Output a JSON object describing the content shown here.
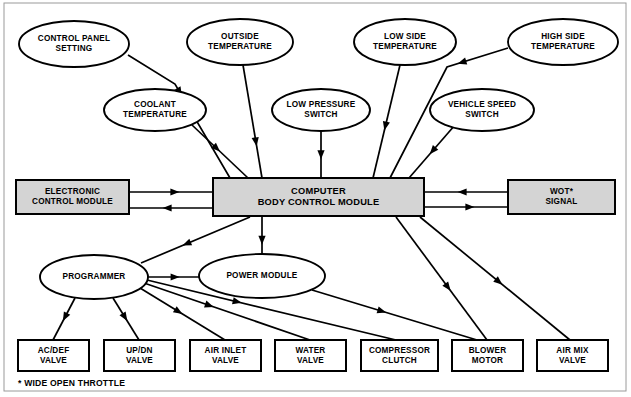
{
  "diagram": {
    "frame": {
      "x": 4,
      "y": 3,
      "w": 622,
      "h": 388,
      "stroke": "#9a9a9a"
    },
    "colors": {
      "shaded_fill": "#d4d4d4",
      "plain_fill": "#ffffff",
      "stroke": "#000000",
      "frame": "#9a9a9a"
    },
    "inputs": [
      {
        "id": "control-panel-setting",
        "label": "CONTROL PANEL\nSETTING",
        "shape": "ellipse",
        "cx": 74,
        "cy": 44,
        "rx": 55,
        "ry": 23
      },
      {
        "id": "outside-temperature",
        "label": "OUTSIDE\nTEMPERATURE",
        "shape": "ellipse",
        "cx": 240,
        "cy": 42,
        "rx": 53,
        "ry": 23
      },
      {
        "id": "low-side-temperature",
        "label": "LOW SIDE\nTEMPERATURE",
        "shape": "ellipse",
        "cx": 405,
        "cy": 42,
        "rx": 51,
        "ry": 23
      },
      {
        "id": "high-side-temperature",
        "label": "HIGH SIDE\nTEMPERATURE",
        "shape": "ellipse",
        "cx": 563,
        "cy": 42,
        "rx": 55,
        "ry": 23
      },
      {
        "id": "coolant-temperature",
        "label": "COOLANT\nTEMPERATURE",
        "shape": "ellipse",
        "cx": 155,
        "cy": 110,
        "rx": 51,
        "ry": 21
      },
      {
        "id": "low-pressure-switch",
        "label": "LOW PRESSURE\nSWITCH",
        "shape": "ellipse",
        "cx": 321,
        "cy": 110,
        "rx": 49,
        "ry": 21
      },
      {
        "id": "vehicle-speed-switch",
        "label": "VEHICLE SPEED\nSWITCH",
        "shape": "ellipse",
        "cx": 482,
        "cy": 110,
        "rx": 52,
        "ry": 21
      }
    ],
    "modules": [
      {
        "id": "electronic-control-module",
        "label": "ELECTRONIC\nCONTROL MODULE",
        "shape": "rect",
        "x": 16,
        "y": 180,
        "w": 113,
        "h": 34,
        "shaded": true
      },
      {
        "id": "computer-body-control-module",
        "label": "COMPUTER\nBODY CONTROL MODULE",
        "shape": "rect",
        "x": 213,
        "y": 178,
        "w": 211,
        "h": 38,
        "shaded": true
      },
      {
        "id": "wot-signal",
        "label": "WOT*\nSIGNAL",
        "shape": "rect",
        "x": 508,
        "y": 180,
        "w": 107,
        "h": 34,
        "shaded": true
      },
      {
        "id": "programmer",
        "label": "PROGRAMMER",
        "shape": "ellipse",
        "cx": 94,
        "cy": 277,
        "rx": 54,
        "ry": 22
      },
      {
        "id": "power-module",
        "label": "POWER MODULE",
        "shape": "ellipse",
        "cx": 262,
        "cy": 276,
        "rx": 63,
        "ry": 22
      }
    ],
    "outputs": [
      {
        "id": "ac-def-valve",
        "label": "AC/DEF\nVALVE",
        "x": 18,
        "y": 340,
        "w": 71,
        "h": 31
      },
      {
        "id": "up-dn-valve",
        "label": "UP/DN\nVALVE",
        "x": 104,
        "y": 340,
        "w": 71,
        "h": 31
      },
      {
        "id": "air-inlet-valve",
        "label": "AIR INLET\nVALVE",
        "x": 190,
        "y": 340,
        "w": 71,
        "h": 31
      },
      {
        "id": "water-valve",
        "label": "WATER\nVALVE",
        "x": 275,
        "y": 340,
        "w": 71,
        "h": 31
      },
      {
        "id": "compressor-clutch",
        "label": "COMPRESSOR\nCLUTCH",
        "x": 361,
        "y": 340,
        "w": 77,
        "h": 31
      },
      {
        "id": "blower-motor",
        "label": "BLOWER\nMOTOR",
        "x": 452,
        "y": 340,
        "w": 71,
        "h": 31
      },
      {
        "id": "air-mix-valve",
        "label": "AIR MIX\nVALVE",
        "x": 537,
        "y": 340,
        "w": 71,
        "h": 31
      }
    ],
    "footnote": "* WIDE OPEN THROTTLE",
    "connections": [
      {
        "id": "control-panel-to-cbcm",
        "from": "control-panel-setting",
        "to": "computer-body-control-module",
        "points": "128,55 175,84 230,178",
        "arrow_at": 0.42
      },
      {
        "id": "outside-temp-to-cbcm",
        "from": "outside-temperature",
        "to": "computer-body-control-module",
        "points": "243,65 262,178",
        "arrow_at": 0.72
      },
      {
        "id": "coolant-temp-to-cbcm",
        "from": "coolant-temperature",
        "to": "computer-body-control-module",
        "points": "192,125 248,178",
        "arrow_at": 0.5
      },
      {
        "id": "low-pressure-to-cbcm",
        "from": "low-pressure-switch",
        "to": "computer-body-control-module",
        "points": "321,131 321,178",
        "arrow_at": 0.6
      },
      {
        "id": "low-side-temp-to-cbcm",
        "from": "low-side-temperature",
        "to": "computer-body-control-module",
        "points": "400,65 373,178",
        "arrow_at": 0.58
      },
      {
        "id": "high-side-temp-to-cbcm",
        "from": "high-side-temperature",
        "to": "computer-body-control-module",
        "points": "508,48 447,67 390,178",
        "arrow_at": 0.28
      },
      {
        "id": "vehicle-speed-to-cbcm",
        "from": "vehicle-speed-switch",
        "to": "computer-body-control-module",
        "points": "455,125 409,178",
        "arrow_at": 0.55
      },
      {
        "id": "ecm-to-cbcm",
        "from": "electronic-control-module",
        "to": "computer-body-control-module",
        "points": "129,192 213,192",
        "arrow_at": 0.6
      },
      {
        "id": "cbcm-to-ecm",
        "from": "computer-body-control-module",
        "to": "electronic-control-module",
        "points": "213,208 129,208",
        "arrow_at": 0.6
      },
      {
        "id": "wot-to-cbcm",
        "from": "wot-signal",
        "to": "computer-body-control-module",
        "points": "508,192 424,192",
        "arrow_at": 0.6
      },
      {
        "id": "cbcm-to-wot",
        "from": "computer-body-control-module",
        "to": "wot-signal",
        "points": "424,207 508,207",
        "arrow_at": 0.6
      },
      {
        "id": "cbcm-to-programmer",
        "from": "computer-body-control-module",
        "to": "programmer",
        "points": "250,217 141,263",
        "arrow_at": 0.62
      },
      {
        "id": "cbcm-to-power-module",
        "from": "computer-body-control-module",
        "to": "power-module",
        "points": "262,217 262,254",
        "arrow_at": 0.75
      },
      {
        "id": "programmer-to-power-module",
        "from": "programmer",
        "to": "power-module",
        "points": "148,277 199,277",
        "arrow_at": 0.62
      },
      {
        "id": "programmer-to-ac-def",
        "from": "programmer",
        "to": "ac-def-valve",
        "points": "75,298 53,340",
        "arrow_at": 0.55
      },
      {
        "id": "programmer-to-up-dn",
        "from": "programmer",
        "to": "up-dn-valve",
        "points": "113,298 139,340",
        "arrow_at": 0.55
      },
      {
        "id": "programmer-to-air-inlet",
        "from": "programmer",
        "to": "air-inlet-valve",
        "points": "140,288 225,340",
        "arrow_at": 0.5
      },
      {
        "id": "programmer-to-water",
        "from": "programmer",
        "to": "water-valve",
        "points": "144,283 310,340",
        "arrow_at": 0.42
      },
      {
        "id": "programmer-to-compressor",
        "from": "programmer",
        "to": "compressor-clutch",
        "points": "147,280 396,340",
        "arrow_at": 0.38
      },
      {
        "id": "power-module-to-blower",
        "from": "power-module",
        "to": "blower-motor",
        "points": "312,290 477,340",
        "arrow_at": 0.45
      },
      {
        "id": "cbcm-to-blower",
        "from": "computer-body-control-module",
        "to": "blower-motor",
        "points": "396,217 487,340",
        "arrow_at": 0.6
      },
      {
        "id": "cbcm-to-air-mix",
        "from": "computer-body-control-module",
        "to": "air-mix-valve",
        "points": "420,217 570,340",
        "arrow_at": 0.55
      }
    ]
  }
}
